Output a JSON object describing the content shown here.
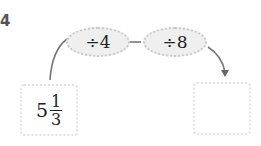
{
  "problem_number": "4",
  "operations": [
    {
      "label": "÷4"
    },
    {
      "label": "÷8"
    }
  ],
  "start_value": {
    "whole": "5",
    "numerator": "1",
    "denominator": "3"
  },
  "result_value": "",
  "colors": {
    "oval_fill": "#efefef",
    "oval_border": "#c8c8c8",
    "arrow": "#666666",
    "box_border": "#e3e3e3"
  }
}
